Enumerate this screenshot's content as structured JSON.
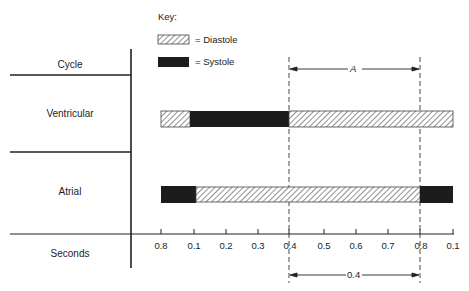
{
  "key": {
    "title": "Key:",
    "items": [
      {
        "pattern": "hatched",
        "label": "= Diastole"
      },
      {
        "pattern": "solid",
        "label": "= Systole"
      }
    ]
  },
  "rows": {
    "cycle": "Cycle",
    "ventricular": "Ventricular",
    "atrial": "Atrial",
    "seconds": "Seconds"
  },
  "annotations": {
    "interval_a": "A",
    "interval_b": "0.4"
  },
  "axis": {
    "ticks": [
      "0.8",
      "0.1",
      "0.2",
      "0.3",
      "0.4",
      "0.5",
      "0.6",
      "0.7",
      "0.8",
      "0.1"
    ]
  },
  "colors": {
    "systole": "#1c1c1c",
    "line": "#222222",
    "hatch": "#555555"
  }
}
